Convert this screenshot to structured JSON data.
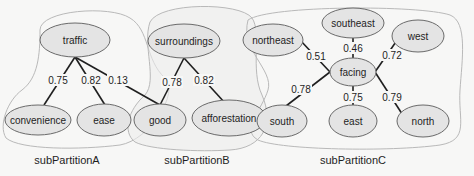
{
  "diagram": {
    "partitions": [
      {
        "id": "A",
        "label": "subPartitionA"
      },
      {
        "id": "B",
        "label": "subPartitionB"
      },
      {
        "id": "C",
        "label": "subPartitionC"
      }
    ],
    "nodes": {
      "traffic": "traffic",
      "convenience": "convenience",
      "ease": "ease",
      "good": "good",
      "surroundings": "surroundings",
      "afforestation": "afforestation",
      "northeast": "northeast",
      "southeast": "southeast",
      "west": "west",
      "facing": "facing",
      "south": "south",
      "east": "east",
      "north": "north"
    },
    "edges": [
      {
        "from": "traffic",
        "to": "convenience",
        "weight": "0.75"
      },
      {
        "from": "traffic",
        "to": "ease",
        "weight": "0.82"
      },
      {
        "from": "traffic",
        "to": "good",
        "weight": "0.13"
      },
      {
        "from": "surroundings",
        "to": "good",
        "weight": "0.78"
      },
      {
        "from": "surroundings",
        "to": "afforestation",
        "weight": "0.82"
      },
      {
        "from": "facing",
        "to": "northeast",
        "weight": "0.51"
      },
      {
        "from": "facing",
        "to": "southeast",
        "weight": "0.46"
      },
      {
        "from": "facing",
        "to": "west",
        "weight": "0.72"
      },
      {
        "from": "facing",
        "to": "south",
        "weight": "0.78"
      },
      {
        "from": "facing",
        "to": "east",
        "weight": "0.75"
      },
      {
        "from": "facing",
        "to": "north",
        "weight": "0.79"
      }
    ]
  }
}
